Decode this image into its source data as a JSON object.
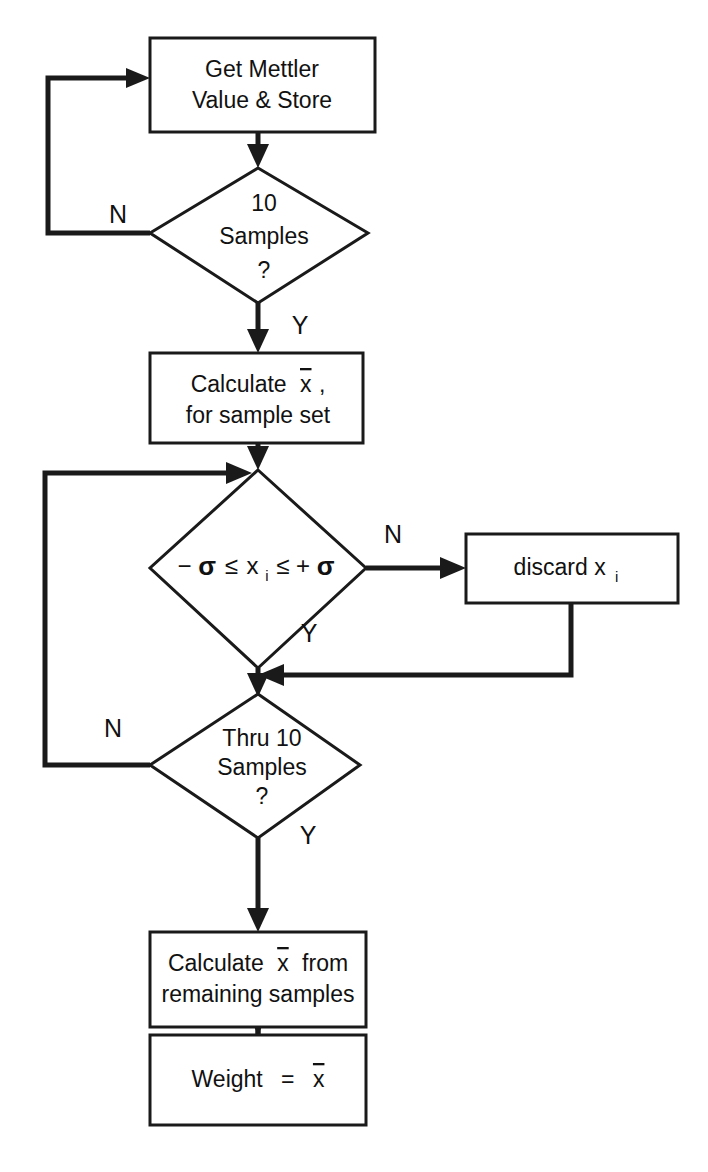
{
  "diagram": {
    "type": "flowchart",
    "background_color": "#ffffff",
    "line_color": "#1a1a1a",
    "nodes": [
      {
        "id": "get-mettler",
        "shape": "process",
        "lines": [
          "Get Mettler",
          "Value & Store"
        ]
      },
      {
        "id": "ten-samples",
        "shape": "decision",
        "lines": [
          "10",
          "Samples",
          "?"
        ]
      },
      {
        "id": "calc-xbar-set",
        "shape": "process",
        "lines": [
          "Calculate x̄,",
          "for sample set"
        ]
      },
      {
        "id": "sigma-range",
        "shape": "decision",
        "lines": [
          "−σ ≤ xᵢ ≤ +σ"
        ],
        "expression": {
          "minus_sigma": "−σ",
          "le_1": "≤",
          "variable": "x",
          "subscript": "i",
          "le_2": "≤",
          "plus_sigma": "+σ"
        }
      },
      {
        "id": "discard-xi",
        "shape": "process",
        "lines": [
          "discard xᵢ"
        ],
        "expression": {
          "word": "discard x",
          "subscript": "i"
        }
      },
      {
        "id": "thru-ten-samples",
        "shape": "decision",
        "lines": [
          "Thru 10",
          "Samples",
          "?"
        ]
      },
      {
        "id": "calc-xbar-remaining",
        "shape": "process",
        "lines": [
          "Calculate x̄ from",
          "remaining samples"
        ]
      },
      {
        "id": "weight-result",
        "shape": "process",
        "lines": [
          "Weight  =  x̄"
        ]
      }
    ],
    "branch_labels": {
      "ten_samples_no": "N",
      "ten_samples_yes": "Y",
      "sigma_no": "N",
      "sigma_yes": "Y",
      "thru_ten_no": "N",
      "thru_ten_yes": "Y"
    },
    "text_fragments": {
      "calc1_line1_word": "Calculate",
      "calc1_line1_xbar": "x",
      "calc1_line1_comma": ",",
      "calc1_line2": "for sample set",
      "calc2_line1_word": "Calculate",
      "calc2_line1_xbar": "x",
      "calc2_line1_from": "from",
      "calc2_line2": "remaining samples",
      "weight_word": "Weight",
      "weight_eq": "=",
      "weight_xbar": "x",
      "get_line1": "Get Mettler",
      "get_line2": "Value & Store",
      "ten_line1": "10",
      "ten_line2": "Samples",
      "ten_line3": "?",
      "thru_line1": "Thru 10",
      "thru_line2": "Samples",
      "thru_line3": "?",
      "discard_word": "discard x",
      "discard_sub": "i",
      "sigma_left": "−",
      "sigma_glyph_1": "σ",
      "sigma_le1": "≤",
      "sigma_x": "x",
      "sigma_sub": "i",
      "sigma_le2": "≤",
      "sigma_plus": "+",
      "sigma_glyph_2": "σ"
    }
  }
}
